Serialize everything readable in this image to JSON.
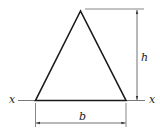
{
  "figure": {
    "shape": "triangle",
    "labels": {
      "height": "h",
      "base": "b",
      "axis_left": "x",
      "axis_right": "x"
    },
    "colors": {
      "stroke": "#1a1a1a",
      "dimension": "#333333"
    }
  }
}
